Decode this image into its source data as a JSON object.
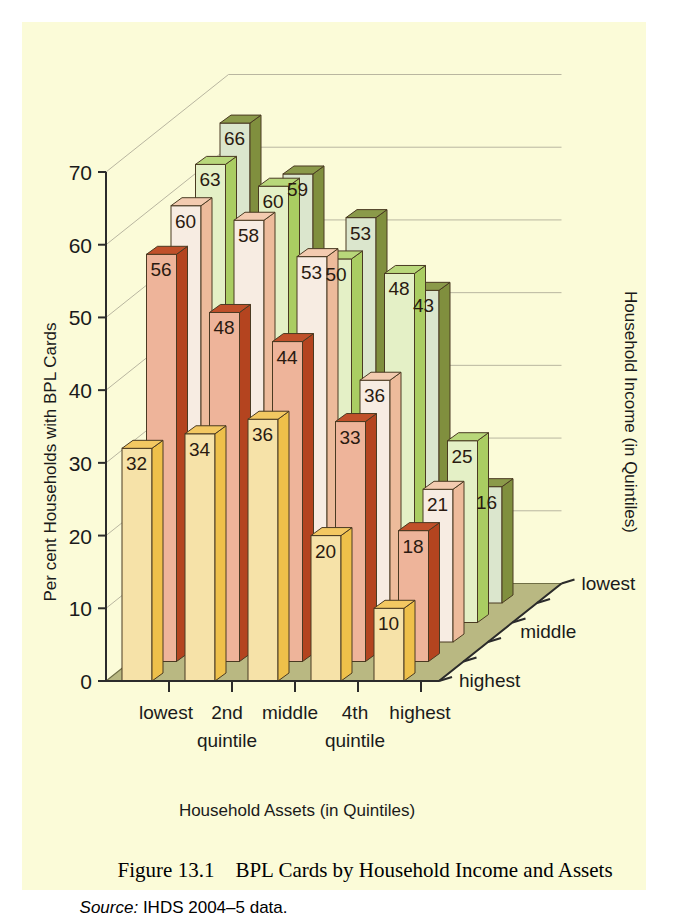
{
  "figure": {
    "caption_label": "Figure 13.1",
    "caption_title": "BPL Cards by Household Income and Assets",
    "source_key": "Source:",
    "source_value": "IHDS 2004–5 data.",
    "caption_color": "#b4512c",
    "background_color": "#fbfbd8",
    "floor_color": "#b9b882"
  },
  "chart_data": {
    "type": "bar",
    "title": "BPL Cards by Household Income and Assets",
    "subtitle": "",
    "xlabel": "Household Assets (in Quintiles)",
    "ylabel": "Per cent Households with BPL Cards",
    "zlabel": "Household Income (in Quintiles)",
    "categories": [
      "lowest",
      "2nd",
      "middle",
      "4th",
      "highest"
    ],
    "category_sublabels": [
      "",
      "quintile",
      "",
      "quintile",
      ""
    ],
    "depth_categories": [
      "lowest",
      "2nd",
      "middle",
      "4th",
      "highest"
    ],
    "depth_tick_labels": [
      "lowest",
      "middle",
      "highest"
    ],
    "ylim": [
      0,
      70
    ],
    "yticks": [
      0,
      10,
      20,
      30,
      40,
      50,
      60,
      70
    ],
    "grid": true,
    "legend_position": "none",
    "series": [
      {
        "name": "lowest",
        "values": [
          56,
          60,
          63,
          66,
          null
        ]
      },
      {
        "name": "2nd",
        "values": [
          48,
          58,
          60,
          59,
          null
        ]
      },
      {
        "name": "middle",
        "values": [
          44,
          53,
          50,
          53,
          null
        ]
      },
      {
        "name": "4th",
        "values": [
          33,
          36,
          48,
          43,
          null
        ]
      },
      {
        "name": "highest",
        "values": [
          18,
          21,
          25,
          16,
          null
        ]
      }
    ],
    "rows": [
      {
        "income": "highest",
        "color": "#f6e2a8",
        "top": "#f3c862",
        "side": "#eec04a",
        "values": [
          32,
          34,
          36,
          20,
          10
        ]
      },
      {
        "income": "4th",
        "color": "#eeb49a",
        "top": "#c0502a",
        "side": "#b4441f",
        "values": [
          56,
          48,
          44,
          33,
          18
        ]
      },
      {
        "income": "middle",
        "color": "#f7ece2",
        "top": "#f3cbb0",
        "side": "#edbb9b",
        "values": [
          60,
          58,
          53,
          36,
          21
        ]
      },
      {
        "income": "2nd",
        "color": "#e4f0c6",
        "top": "#b8d77a",
        "side": "#aacd62",
        "values": [
          63,
          60,
          50,
          48,
          25
        ]
      },
      {
        "income": "lowest",
        "color": "#dbe6cd",
        "top": "#8b9a4a",
        "side": "#808f3e",
        "values": [
          66,
          59,
          53,
          43,
          16
        ]
      }
    ],
    "annotations": {
      "value_labels_shown": true
    }
  },
  "axes": {
    "y_tick_labels": [
      "70",
      "60",
      "50",
      "40",
      "30",
      "20",
      "10",
      "0"
    ],
    "y_axis_title": "Per cent Households with BPL Cards",
    "x_axis_title": "Household Assets (in Quintiles)",
    "z_axis_title": "Household Income (in Quintiles)",
    "x_tick_labels": [
      "lowest",
      "2nd",
      "middle",
      "4th",
      "highest"
    ],
    "x_tick_sublabels": [
      "quintile",
      "quintile"
    ],
    "z_tick_labels": [
      "lowest",
      "middle",
      "highest"
    ]
  }
}
